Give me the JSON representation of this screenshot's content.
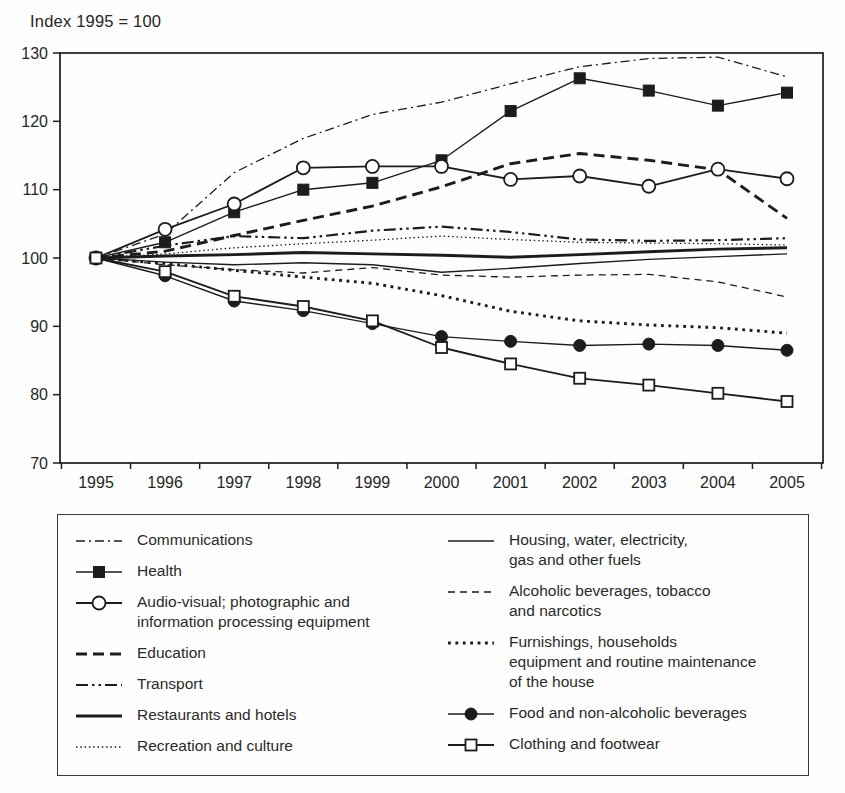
{
  "chart_data": {
    "type": "line",
    "title": "Index 1995 = 100",
    "x": [
      1995,
      1996,
      1997,
      1998,
      1999,
      2000,
      2001,
      2002,
      2003,
      2004,
      2005
    ],
    "xlabel": "",
    "ylabel": "",
    "ylim": [
      70,
      130
    ],
    "yticks": [
      70,
      80,
      90,
      100,
      110,
      120,
      130
    ],
    "grid": false,
    "legend_position": "bottom-box",
    "line_color": "#1c1c1c",
    "legend_columns": [
      [
        "communications",
        "health",
        "audio-visual",
        "education",
        "transport",
        "restaurants",
        "recreation"
      ],
      [
        "housing",
        "alcoholic",
        "furnishings",
        "food",
        "clothing"
      ]
    ],
    "series": [
      {
        "id": "communications",
        "name": "Communications",
        "legend_lines": [
          "Communications"
        ],
        "line": "dashdot-thin",
        "marker": "none",
        "values": [
          100,
          103.5,
          112.5,
          117.5,
          121,
          122.8,
          125.5,
          128,
          129.2,
          129.4,
          126.5
        ]
      },
      {
        "id": "health",
        "name": "Health",
        "legend_lines": [
          "Health"
        ],
        "line": "solid-thin",
        "marker": "filled-square",
        "values": [
          100,
          102.3,
          106.7,
          110,
          111,
          114.3,
          121.5,
          126.3,
          124.5,
          122.3,
          124.2
        ]
      },
      {
        "id": "audio-visual",
        "name": "Audio-visual; photographic and information processing equipment",
        "legend_lines": [
          "Audio-visual; photographic and",
          "information processing equipment"
        ],
        "line": "solid-medium",
        "marker": "open-circle",
        "values": [
          100,
          104.2,
          107.9,
          113.2,
          113.4,
          113.4,
          111.5,
          112,
          110.5,
          113,
          111.6
        ]
      },
      {
        "id": "education",
        "name": "Education",
        "legend_lines": [
          "Education"
        ],
        "line": "dashed-thick",
        "marker": "none",
        "values": [
          100,
          101,
          103.3,
          105.5,
          107.6,
          110.4,
          113.8,
          115.3,
          114.3,
          112.9,
          105.8
        ]
      },
      {
        "id": "transport",
        "name": "Transport",
        "legend_lines": [
          "Transport"
        ],
        "line": "dashdotdot",
        "marker": "none",
        "values": [
          100,
          101.8,
          103.2,
          102.9,
          104,
          104.6,
          103.8,
          102.7,
          102.5,
          102.6,
          102.9
        ]
      },
      {
        "id": "restaurants",
        "name": "Restaurants and hotels",
        "legend_lines": [
          "Restaurants and hotels"
        ],
        "line": "solid-thick",
        "marker": "none",
        "values": [
          100,
          100.3,
          100.5,
          100.8,
          100.6,
          100.4,
          100.1,
          100.5,
          100.9,
          101.3,
          101.5
        ]
      },
      {
        "id": "recreation",
        "name": "Recreation and culture",
        "legend_lines": [
          "Recreation and culture"
        ],
        "line": "dotted-fine",
        "marker": "none",
        "values": [
          100,
          100.6,
          101.5,
          102.1,
          102.6,
          103.2,
          102.7,
          102.3,
          102.2,
          102.1,
          101.9
        ]
      },
      {
        "id": "housing",
        "name": "Housing, water, electricity, gas and other fuels",
        "legend_lines": [
          "Housing, water, electricity,",
          "gas and other fuels"
        ],
        "line": "solid-thin",
        "marker": "none",
        "values": [
          100,
          99.4,
          99,
          99.3,
          99,
          97.9,
          98.5,
          99.2,
          99.8,
          100.2,
          100.6
        ]
      },
      {
        "id": "alcoholic",
        "name": "Alcoholic beverages, tobacco and narcotics",
        "legend_lines": [
          "Alcoholic beverages, tobacco",
          "and narcotics"
        ],
        "line": "dashed-thin",
        "marker": "none",
        "values": [
          100,
          99,
          98.3,
          97.8,
          98.6,
          97.5,
          97.2,
          97.5,
          97.6,
          96.5,
          94.3
        ]
      },
      {
        "id": "furnishings",
        "name": "Furnishings, households equipment and routine maintenance of the house",
        "legend_lines": [
          "Furnishings, households",
          "equipment and routine maintenance",
          "of the house"
        ],
        "line": "dotted-thick",
        "marker": "none",
        "values": [
          100,
          99.2,
          98.2,
          97.2,
          96.3,
          94.5,
          92.2,
          90.8,
          90.2,
          89.8,
          89
        ]
      },
      {
        "id": "food",
        "name": "Food and non-alcoholic beverages",
        "legend_lines": [
          "Food and non-alcoholic beverages"
        ],
        "line": "solid-thin",
        "marker": "filled-circle",
        "values": [
          100,
          97.4,
          93.7,
          92.3,
          90.4,
          88.5,
          87.8,
          87.2,
          87.4,
          87.2,
          86.5
        ]
      },
      {
        "id": "clothing",
        "name": "Clothing and footwear",
        "legend_lines": [
          "Clothing and footwear"
        ],
        "line": "solid-medium",
        "marker": "open-square",
        "values": [
          100,
          98,
          94.4,
          92.9,
          90.8,
          86.9,
          84.5,
          82.4,
          81.4,
          80.2,
          79
        ]
      }
    ]
  }
}
